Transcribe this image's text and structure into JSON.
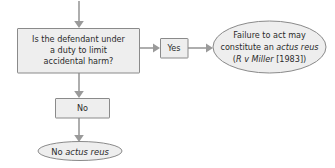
{
  "diagram": {
    "colors": {
      "node_fill": "#eeeeee",
      "node_stroke": "#8a8a8a",
      "connector": "#9a9a9a",
      "text": "#2b2b2b",
      "background": "#ffffff"
    },
    "decision": {
      "id": "duty-question",
      "shape": "rectangle",
      "lines": [
        "Is the defendant under",
        "a duty to limit",
        "accidental harm?"
      ]
    },
    "branch_yes": {
      "id": "yes-branch",
      "shape": "rectangle",
      "label": "Yes"
    },
    "branch_no": {
      "id": "no-branch",
      "shape": "rectangle",
      "label": "No"
    },
    "outcome_yes": {
      "id": "actus-reus-outcome",
      "shape": "ellipse",
      "line1": "Failure to act may",
      "line2_prefix": "constitute an ",
      "line2_italic": "actus reus",
      "line3_open": "(",
      "line3_italic": "R v Miller",
      "line3_close": " [1983])"
    },
    "outcome_no": {
      "id": "no-actus-reus-outcome",
      "shape": "ellipse",
      "prefix": "No ",
      "italic": "actus reus"
    },
    "connectors": [
      {
        "name": "entry-arrow",
        "from": "top-edge",
        "to": "duty-question",
        "direction": "down"
      },
      {
        "name": "yes-arrow",
        "from": "duty-question",
        "to": "yes-branch",
        "direction": "right"
      },
      {
        "name": "outcome-arrow",
        "from": "yes-branch",
        "to": "actus-reus-outcome",
        "direction": "right"
      },
      {
        "name": "no-arrow",
        "from": "duty-question",
        "to": "no-branch",
        "direction": "down"
      },
      {
        "name": "terminal-arrow",
        "from": "no-branch",
        "to": "no-actus-reus-outcome",
        "direction": "down"
      }
    ]
  }
}
